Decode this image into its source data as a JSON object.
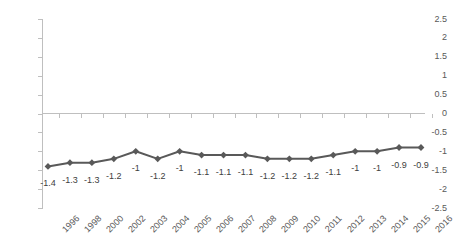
{
  "chart_data": {
    "type": "line",
    "title": "",
    "subtitle": "",
    "xlabel": "",
    "ylabel": "",
    "categories": [
      "1996",
      "1998",
      "2000",
      "2002",
      "2003",
      "2004",
      "2005",
      "2006",
      "2007",
      "2008",
      "2009",
      "2010",
      "2011",
      "2012",
      "2013",
      "2014",
      "2015",
      "2016"
    ],
    "values": [
      -1.4,
      -1.3,
      -1.3,
      -1.2,
      -1,
      -1.2,
      -1,
      -1.1,
      -1.1,
      -1.1,
      -1.2,
      -1.2,
      -1.2,
      -1.1,
      -1,
      -1,
      -0.9,
      -0.9
    ],
    "point_labels": [
      "-1.4",
      "-1.3",
      "-1.3",
      "-1.2",
      "-1",
      "-1.2",
      "-1",
      "-1.1",
      "-1.1",
      "-1.1",
      "-1.2",
      "-1.2",
      "-1.2",
      "-1.1",
      "-1",
      "-1",
      "-0.9",
      "-0.9"
    ],
    "ylim": [
      -2.5,
      2.5
    ],
    "ytick_values": [
      2.5,
      2,
      1.5,
      1,
      0.5,
      0,
      -0.5,
      -1,
      -1.5,
      -2,
      -2.5
    ],
    "ytick_labels": [
      "2.5",
      "2",
      "1.5",
      "1",
      "0.5",
      "0",
      "-0.5",
      "-1",
      "-1.5",
      "-2",
      "-2.5"
    ],
    "grid": false,
    "legend": false,
    "legend_position": "none",
    "series": [
      {
        "name": "series-1",
        "values": [
          -1.4,
          -1.3,
          -1.3,
          -1.2,
          -1,
          -1.2,
          -1,
          -1.1,
          -1.1,
          -1.1,
          -1.2,
          -1.2,
          -1.2,
          -1.1,
          -1,
          -1,
          -0.9,
          -0.9
        ],
        "color": "#595959",
        "marker": "diamond",
        "marker_color": "#595959"
      }
    ],
    "colors": {
      "line": "#595959",
      "marker": "#595959",
      "axis": "#bfbfbf",
      "tick_text": "#595959",
      "label_text": "#404040",
      "background": "#ffffff"
    }
  }
}
